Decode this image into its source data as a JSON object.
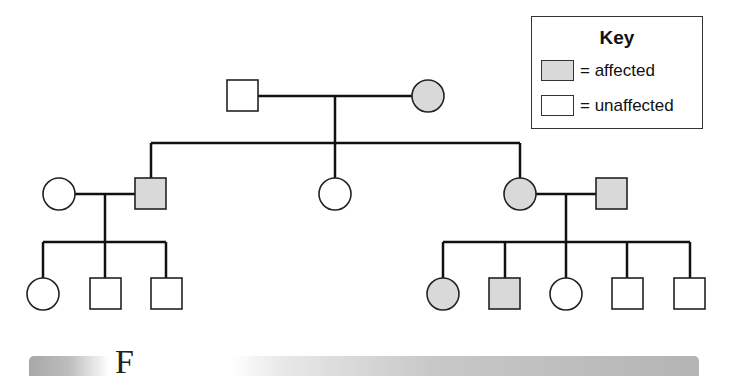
{
  "diagram": {
    "type": "pedigree",
    "colors": {
      "affected_fill": "#d9d9d9",
      "unaffected_fill": "#ffffff",
      "line": "#111111"
    },
    "generations": [
      {
        "id": "I",
        "individuals": [
          {
            "id": "I-1",
            "sex": "male",
            "shape": "square",
            "affected": false
          },
          {
            "id": "I-2",
            "sex": "female",
            "shape": "circle",
            "affected": true
          }
        ]
      },
      {
        "id": "II",
        "individuals": [
          {
            "id": "II-spouse-1",
            "sex": "female",
            "shape": "circle",
            "affected": false,
            "married_in": true
          },
          {
            "id": "II-1",
            "sex": "male",
            "shape": "square",
            "affected": true
          },
          {
            "id": "II-2",
            "sex": "female",
            "shape": "circle",
            "affected": false
          },
          {
            "id": "II-3",
            "sex": "female",
            "shape": "circle",
            "affected": true
          },
          {
            "id": "II-spouse-2",
            "sex": "male",
            "shape": "square",
            "affected": true,
            "married_in": true
          }
        ]
      },
      {
        "id": "III",
        "individuals": [
          {
            "id": "III-1",
            "sex": "female",
            "shape": "circle",
            "affected": false,
            "parents": "II-spouse-1 x II-1"
          },
          {
            "id": "III-2",
            "sex": "male",
            "shape": "square",
            "affected": false,
            "parents": "II-spouse-1 x II-1"
          },
          {
            "id": "III-3",
            "sex": "male",
            "shape": "square",
            "affected": false,
            "parents": "II-spouse-1 x II-1"
          },
          {
            "id": "III-4",
            "sex": "female",
            "shape": "circle",
            "affected": true,
            "parents": "II-3 x II-spouse-2"
          },
          {
            "id": "III-5",
            "sex": "male",
            "shape": "square",
            "affected": true,
            "parents": "II-3 x II-spouse-2"
          },
          {
            "id": "III-6",
            "sex": "female",
            "shape": "circle",
            "affected": false,
            "parents": "II-3 x II-spouse-2"
          },
          {
            "id": "III-7",
            "sex": "male",
            "shape": "square",
            "affected": false,
            "parents": "II-3 x II-spouse-2"
          },
          {
            "id": "III-8",
            "sex": "male",
            "shape": "square",
            "affected": false,
            "parents": "II-3 x II-spouse-2"
          }
        ]
      }
    ]
  },
  "key": {
    "title": "Key",
    "items": [
      {
        "label": "= affected",
        "fill": "#d9d9d9"
      },
      {
        "label": "= unaffected",
        "fill": "#ffffff"
      }
    ]
  },
  "figure_caption": {
    "label": "F"
  }
}
